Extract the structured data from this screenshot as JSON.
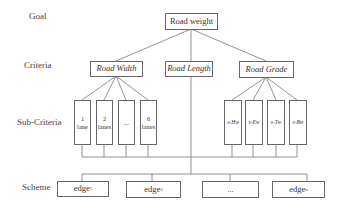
{
  "levels": {
    "goal": "Goal",
    "criteria": "Criteria",
    "sub_criteria": "Sub-Criteria",
    "scheme": "Scheme"
  },
  "goal": {
    "label": "Road weight"
  },
  "criteria": [
    {
      "label": "Road Width"
    },
    {
      "label": "Road Length"
    },
    {
      "label": "Road Grade"
    }
  ],
  "sub_criteria_width": [
    {
      "line1": "1",
      "line2": "lane"
    },
    {
      "line1": "2",
      "line2": "lanes"
    },
    {
      "line1": "...",
      "line2": ""
    },
    {
      "line1": "6",
      "line2": "lanes"
    }
  ],
  "sub_criteria_grade": [
    {
      "label": "s-Hw"
    },
    {
      "label": "s-Ew"
    },
    {
      "label": "s-Tw"
    },
    {
      "label": "s-Bw"
    }
  ],
  "scheme": [
    {
      "base": "edge",
      "sub": "1"
    },
    {
      "base": "edge",
      "sub": "2"
    },
    {
      "base": "...",
      "sub": ""
    },
    {
      "base": "edge",
      "sub": "n"
    }
  ]
}
